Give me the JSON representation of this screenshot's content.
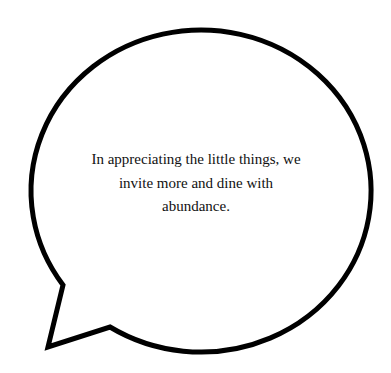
{
  "bubble": {
    "stroke_color": "#000000",
    "fill_color": "#ffffff",
    "stroke_width": 5
  },
  "quote": {
    "lines": [
      "In appreciating the little things, we",
      "invite more and dine with",
      "abundance."
    ],
    "text_color": "#111111"
  }
}
